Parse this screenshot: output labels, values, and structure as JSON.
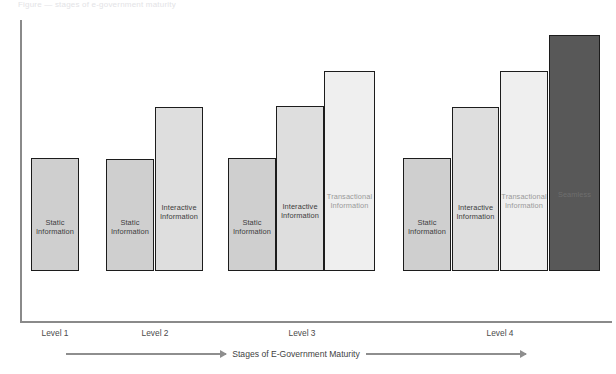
{
  "figure": {
    "caption_fragment": "Figure  —  stages of e-government maturity",
    "axis_arrow_label": "Stages of E-Government Maturity",
    "background_color": "#ffffff",
    "axis_color": "#8a8a8a",
    "bar_outline_color": "#1c1c1c"
  },
  "chart_data": {
    "type": "bar",
    "title": "",
    "subtitle": "",
    "xlabel": "Stages of E-Government Maturity",
    "ylabel": "",
    "grid": false,
    "legend_position": "none",
    "axis_ranges": {
      "y": [
        0,
        100
      ],
      "x_categories": [
        "Level 1",
        "Level 2",
        "Level 3",
        "Level 4"
      ]
    },
    "categories": [
      "Level 1",
      "Level 2",
      "Level 3",
      "Level 4"
    ],
    "series": [
      {
        "name": "Static Information",
        "shade": "shade-static",
        "color": "#cfcfcf",
        "values": [
          37,
          37,
          37,
          37
        ]
      },
      {
        "name": "Interactive Information",
        "shade": "shade-interactive",
        "color": "#dedede",
        "values": [
          null,
          54,
          54,
          54
        ]
      },
      {
        "name": "Transactional Information",
        "shade": "shade-transactional",
        "color": "#efefef",
        "values": [
          null,
          null,
          66,
          66
        ]
      },
      {
        "name": "Seamless",
        "shade": "shade-seamless",
        "color": "#585858",
        "values": [
          null,
          null,
          null,
          78
        ]
      }
    ],
    "groups": [
      {
        "level_label": "Level 1",
        "label_center_x": 55,
        "bars": [
          {
            "label": "Static\nInformation",
            "shade": "shade-static",
            "x": 31,
            "width": 48,
            "top": 209,
            "value": 37
          }
        ]
      },
      {
        "level_label": "Level 2",
        "label_center_x": 155,
        "bars": [
          {
            "label": "Static\nInformation",
            "shade": "shade-static",
            "x": 106,
            "width": 48,
            "top": 210,
            "value": 37
          },
          {
            "label": "Interactive\nInformation",
            "shade": "shade-interactive",
            "x": 155,
            "width": 48,
            "top": 158,
            "value": 54
          }
        ]
      },
      {
        "level_label": "Level 3",
        "label_center_x": 302,
        "bars": [
          {
            "label": "Static\nInformation",
            "shade": "shade-static",
            "x": 228,
            "width": 48,
            "top": 209,
            "value": 37
          },
          {
            "label": "Interactive\nInformation",
            "shade": "shade-interactive",
            "x": 276,
            "width": 48,
            "top": 157,
            "value": 54
          },
          {
            "label": "Transactional\nInformation",
            "shade": "shade-transactional",
            "x": 324,
            "width": 51,
            "top": 122,
            "value": 66
          }
        ]
      },
      {
        "level_label": "Level 4",
        "label_center_x": 500,
        "bars": [
          {
            "label": "Static\nInformation",
            "shade": "shade-static",
            "x": 403,
            "width": 48,
            "top": 209,
            "value": 37
          },
          {
            "label": "Interactive\nInformation",
            "shade": "shade-interactive",
            "x": 452,
            "width": 47,
            "top": 158,
            "value": 54
          },
          {
            "label": "Transactional\nInformation",
            "shade": "shade-transactional",
            "x": 500,
            "width": 48,
            "top": 122,
            "value": 66
          },
          {
            "label": "Seamless",
            "shade": "shade-seamless",
            "x": 549,
            "width": 51,
            "top": 86,
            "value": 78
          }
        ]
      }
    ],
    "annotations": [
      {
        "text": "Stages of E-Government Maturity",
        "kind": "axis-arrow",
        "direction": "left-to-right"
      }
    ]
  }
}
